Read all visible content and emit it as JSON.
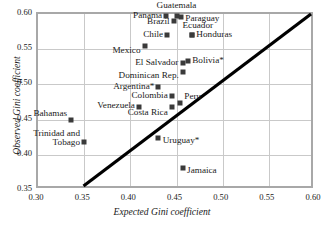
{
  "chart_data": {
    "type": "scatter",
    "title": "",
    "xlabel": "Expected Gini coefficient",
    "ylabel": "Observed Gini coefficient",
    "xlim": [
      0.3,
      0.6
    ],
    "ylim": [
      0.35,
      0.6
    ],
    "xticks": [
      "0.30",
      "0.35",
      "0.40",
      "0.45",
      "0.50",
      "0.55",
      "0.60"
    ],
    "yticks": [
      "0.35",
      "0.40",
      "0.45",
      "0.50",
      "0.55",
      "0.60"
    ],
    "xtick_values": [
      0.3,
      0.35,
      0.4,
      0.45,
      0.5,
      0.55,
      0.6
    ],
    "ytick_values": [
      0.35,
      0.4,
      0.45,
      0.5,
      0.55,
      0.6
    ],
    "grid": true,
    "legend": "none",
    "reference_line": {
      "name": "identity-line",
      "equation": "y = x",
      "from": [
        0.35,
        0.35
      ],
      "to": [
        0.6,
        0.6
      ],
      "color": "#000000"
    },
    "marker": {
      "shape": "square",
      "color": "#3a3a3a",
      "size": 5
    },
    "points": [
      {
        "label": "Guatemala",
        "x": 0.45,
        "y": 0.597,
        "lx": 0.45,
        "ly": 0.6115,
        "anchor": "c"
      },
      {
        "label": "Panama",
        "x": 0.439,
        "y": 0.597,
        "lx": 0.4345,
        "ly": 0.597,
        "anchor": "r"
      },
      {
        "label": "Paraguay",
        "x": 0.455,
        "y": 0.5955,
        "lx": 0.4595,
        "ly": 0.5935,
        "anchor": "l"
      },
      {
        "label": "Brazil",
        "x": 0.4475,
        "y": 0.59,
        "lx": 0.4425,
        "ly": 0.5885,
        "anchor": "r"
      },
      {
        "label": "Ecuador",
        "x": 0.467,
        "y": 0.57,
        "lx": 0.4565,
        "ly": 0.5835,
        "anchor": "l"
      },
      {
        "label": "Chile",
        "x": 0.44,
        "y": 0.57,
        "lx": 0.4355,
        "ly": 0.57,
        "anchor": "r"
      },
      {
        "label": "Honduras",
        "x": 0.467,
        "y": 0.57,
        "lx": 0.4715,
        "ly": 0.5705,
        "anchor": "l"
      },
      {
        "label": "Mexico",
        "x": 0.4155,
        "y": 0.554,
        "lx": 0.411,
        "ly": 0.5475,
        "anchor": "r"
      },
      {
        "label": "Bolivia*",
        "x": 0.4625,
        "y": 0.533,
        "lx": 0.467,
        "ly": 0.5335,
        "anchor": "l"
      },
      {
        "label": "El Salvador",
        "x": 0.4565,
        "y": 0.5305,
        "lx": 0.452,
        "ly": 0.5305,
        "anchor": "r"
      },
      {
        "label": "Dominican Rep.",
        "x": 0.457,
        "y": 0.518,
        "lx": 0.4525,
        "ly": 0.5115,
        "anchor": "r"
      },
      {
        "label": "Argentina*",
        "x": 0.4305,
        "y": 0.4965,
        "lx": 0.426,
        "ly": 0.4965,
        "anchor": "r"
      },
      {
        "label": "Colombia",
        "x": 0.445,
        "y": 0.4835,
        "lx": 0.4405,
        "ly": 0.4835,
        "anchor": "r"
      },
      {
        "label": "Peru",
        "x": 0.454,
        "y": 0.4735,
        "lx": 0.4585,
        "ly": 0.4815,
        "anchor": "l"
      },
      {
        "label": "Venezuela",
        "x": 0.4095,
        "y": 0.4675,
        "lx": 0.405,
        "ly": 0.469,
        "anchor": "r"
      },
      {
        "label": "Costa Rica",
        "x": 0.445,
        "y": 0.4675,
        "lx": 0.4405,
        "ly": 0.4595,
        "anchor": "r"
      },
      {
        "label": "Bahamas",
        "x": 0.336,
        "y": 0.45,
        "lx": 0.3315,
        "ly": 0.4585,
        "anchor": "r"
      },
      {
        "label": "Trinidad and\nTobago",
        "x": 0.35,
        "y": 0.4175,
        "lx": 0.3455,
        "ly": 0.4235,
        "anchor": "r"
      },
      {
        "label": "Uruguay*",
        "x": 0.4305,
        "y": 0.424,
        "lx": 0.435,
        "ly": 0.4195,
        "anchor": "l"
      },
      {
        "label": "Jamaica",
        "x": 0.457,
        "y": 0.3815,
        "lx": 0.4615,
        "ly": 0.3775,
        "anchor": "l"
      }
    ]
  }
}
